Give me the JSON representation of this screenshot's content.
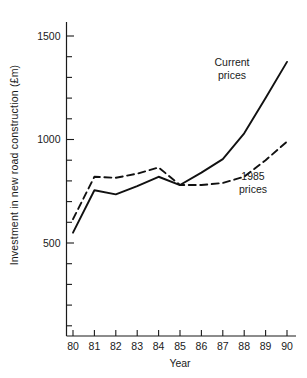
{
  "chart_data": {
    "type": "line",
    "title": "",
    "xlabel": "Year",
    "ylabel": "Investment in new road construction (£m)",
    "x": [
      80,
      81,
      82,
      83,
      84,
      85,
      86,
      87,
      88,
      89,
      90
    ],
    "xtick_labels": [
      "80",
      "81",
      "82",
      "83",
      "84",
      "85",
      "86",
      "87",
      "88",
      "89",
      "90"
    ],
    "xlim": [
      79.3,
      90.6
    ],
    "ylim": [
      0,
      1600
    ],
    "ytick_values": [
      500,
      1000,
      1500
    ],
    "ytick_labels": [
      "500",
      "1000",
      "1500"
    ],
    "yminor_step": 100,
    "grid": false,
    "legend_position": "inline-annotation",
    "series": [
      {
        "name": "Current prices",
        "style": "solid",
        "color": "#111111",
        "label_lines": [
          "Current",
          "prices"
        ],
        "values": [
          550,
          755,
          735,
          775,
          820,
          780,
          840,
          905,
          1030,
          1200,
          1375
        ]
      },
      {
        "name": "1985 prices",
        "style": "dashed",
        "color": "#111111",
        "label_lines": [
          "1985",
          "prices"
        ],
        "values": [
          615,
          820,
          815,
          835,
          865,
          780,
          780,
          790,
          820,
          900,
          990
        ]
      }
    ],
    "annotations": [
      {
        "text": "Current prices",
        "series": "Current prices"
      },
      {
        "text": "1985 prices",
        "series": "1985 prices"
      }
    ]
  },
  "axis": {
    "x_title": "Year",
    "y_title": "Investment in new road construction (£m)"
  }
}
